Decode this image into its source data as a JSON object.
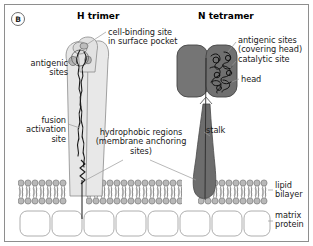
{
  "figure": {
    "panel_letter": "B",
    "titles": {
      "left": "H trimer",
      "right": "N tetramer"
    },
    "labels": {
      "cell_binding_site": "cell-binding site\nin surface pocket",
      "antigenic_sites_h": "antigenic\nsites",
      "fusion_activation_site": "fusion\nactivation\nsite",
      "hydrophobic_regions": "hydrophobic regions\n(membrane anchoring\nsites)",
      "antigenic_sites_n": "antigenic sites\n(covering head)\ncatalytic site",
      "head": "head",
      "stalk": "stalk",
      "lipid_bilayer": "lipid\nbilayer",
      "matrix_protein": "matrix\nprotein"
    }
  },
  "colors": {
    "frame_border": "#8e8e8e",
    "h_trimer_fill": "#e6e6e6",
    "h_trimer_stroke": "#8a8a8a",
    "n_tetramer_fill": "#707070",
    "n_tetramer_stroke": "#4a4a4a",
    "lipid_head_fill": "#b8b8b8",
    "lipid_head_stroke": "#6f6f6f",
    "matrix_fill": "#ffffff",
    "matrix_stroke": "#9a9a9a",
    "squiggle_stroke": "#1a1a1a",
    "leader_line": "#9a9a9a",
    "text": "#1a1a1a"
  }
}
